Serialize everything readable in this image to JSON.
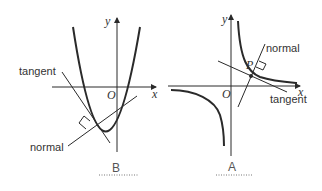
{
  "left_figure": {
    "axis_x": "x",
    "axis_y": "y",
    "origin": "O",
    "tangent_label": "tangent",
    "normal_label": "normal",
    "caption": "B",
    "curve": "parabola"
  },
  "right_figure": {
    "axis_x": "x",
    "axis_y": "y",
    "origin": "O",
    "point_label": "P",
    "tangent_label": "tangent",
    "normal_label": "normal",
    "caption": "A",
    "curve": "hyperbola"
  },
  "colors": {
    "stroke": "#2a2a2a",
    "text": "#333333",
    "dots": "#777777"
  }
}
